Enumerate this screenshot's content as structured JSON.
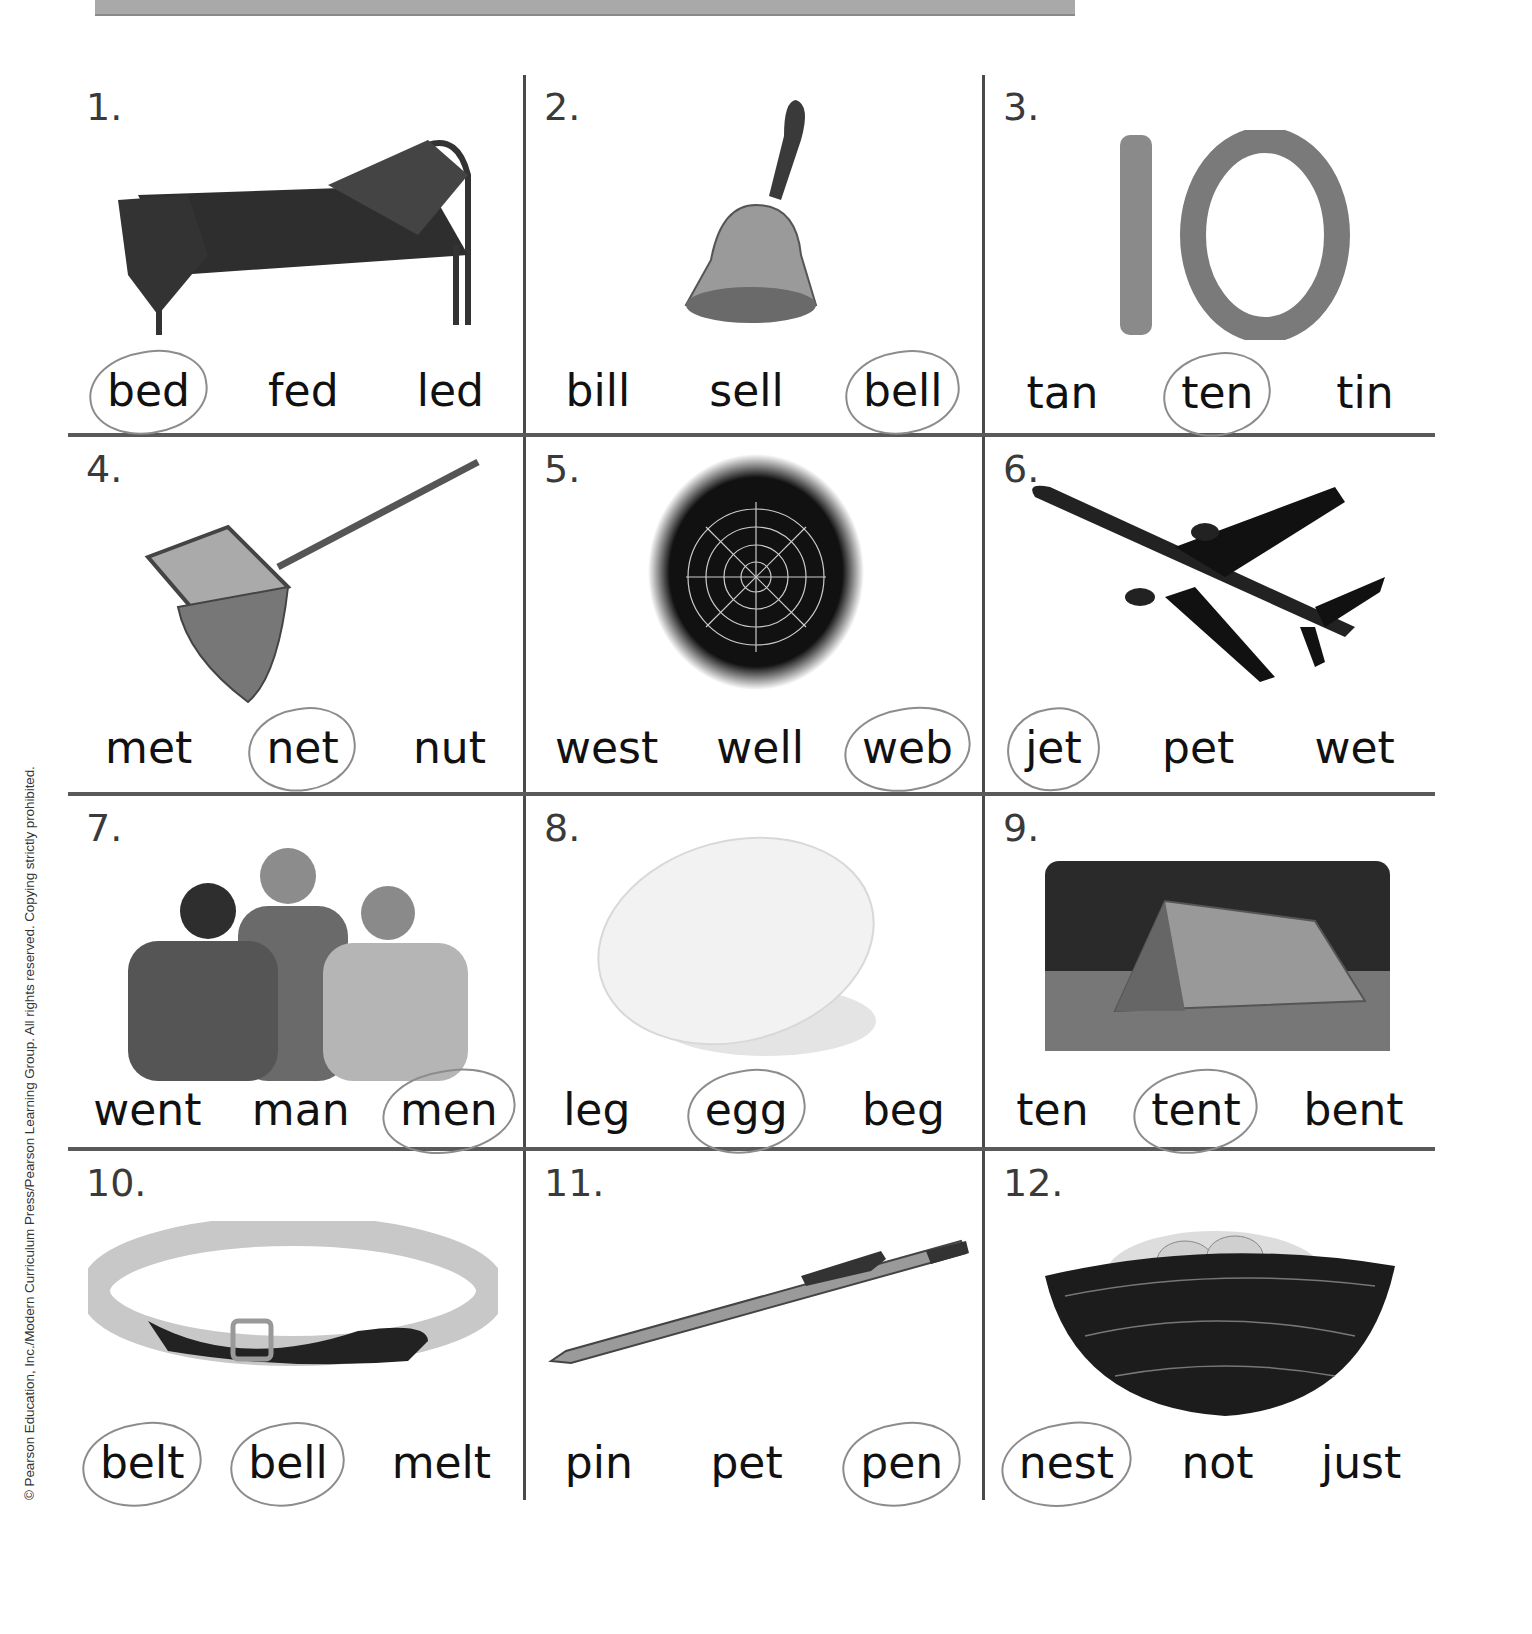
{
  "header": {
    "bar": "gray banner strip (cropped)"
  },
  "copyright": "© Pearson Education, Inc./Modern Curriculum Press/Pearson Learning Group. All rights reserved. Copying strictly prohibited.",
  "worksheet": {
    "cells": [
      {
        "number": "1.",
        "image": "bed",
        "words": [
          "bed",
          "fed",
          "led"
        ],
        "circled": 0
      },
      {
        "number": "2.",
        "image": "bell",
        "words": [
          "bill",
          "sell",
          "bell"
        ],
        "circled": 2
      },
      {
        "number": "3.",
        "image": "number-10",
        "words": [
          "tan",
          "ten",
          "tin"
        ],
        "circled": 1
      },
      {
        "number": "4.",
        "image": "fishing-net",
        "words": [
          "met",
          "net",
          "nut"
        ],
        "circled": 1
      },
      {
        "number": "5.",
        "image": "spider-web",
        "words": [
          "west",
          "well",
          "web"
        ],
        "circled": 2
      },
      {
        "number": "6.",
        "image": "jet-plane",
        "words": [
          "jet",
          "pet",
          "wet"
        ],
        "circled": 0
      },
      {
        "number": "7.",
        "image": "three-men",
        "words": [
          "went",
          "man",
          "men"
        ],
        "circled": 2
      },
      {
        "number": "8.",
        "image": "egg",
        "words": [
          "leg",
          "egg",
          "beg"
        ],
        "circled": 1
      },
      {
        "number": "9.",
        "image": "tent",
        "words": [
          "ten",
          "tent",
          "bent"
        ],
        "circled": 1
      },
      {
        "number": "10.",
        "image": "belt",
        "words": [
          "belt",
          "bell",
          "melt"
        ],
        "circled": 0
      },
      {
        "number": "11.",
        "image": "pen",
        "words": [
          "pin",
          "pet",
          "pen"
        ],
        "circled": 2
      },
      {
        "number": "12.",
        "image": "nest",
        "words": [
          "nest",
          "not",
          "just"
        ],
        "circled": 0
      }
    ]
  },
  "colors": {
    "grid_line": "#4a4a4a",
    "text": "#111111",
    "pencil": "#8c8c8c",
    "banner": "#a9a9a9"
  }
}
